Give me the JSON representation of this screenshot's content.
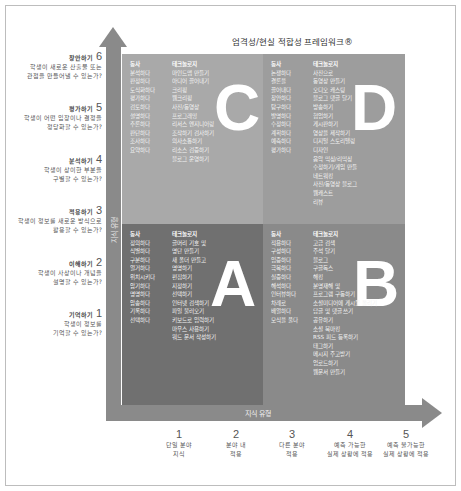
{
  "title": "엄격성/현실 적합성 프레임워크®",
  "axes": {
    "vertical_label": "지식 유형",
    "horizontal_label": "지식 유형"
  },
  "levels": [
    {
      "num": "6",
      "name": "창안하기",
      "desc1": "학생이 새로운 산출물 또는",
      "desc2": "관점을 만들어낼 수 있는가?"
    },
    {
      "num": "5",
      "name": "평가하기",
      "desc1": "학생이 어떤 입장이나 결정을",
      "desc2": "정당화할 수 있는가?"
    },
    {
      "num": "4",
      "name": "분석하기",
      "desc1": "학생이 상이한 부분을",
      "desc2": "구별할 수 있는가?"
    },
    {
      "num": "3",
      "name": "적용하기",
      "desc1": "학생이 정보를 새로운 방식으로",
      "desc2": "활용할 수 있는가?"
    },
    {
      "num": "2",
      "name": "이해하기",
      "desc1": "학생이 사상이나 개념을",
      "desc2": "설명할 수 있는가?"
    },
    {
      "num": "1",
      "name": "기억하기",
      "desc1": "학생이 정보를",
      "desc2": "기억할 수 있는가?"
    }
  ],
  "ticks": [
    {
      "num": "1",
      "line1": "단일 분야",
      "line2": "지식"
    },
    {
      "num": "2",
      "line1": "분야 내",
      "line2": "적용"
    },
    {
      "num": "3",
      "line1": "다른 분야",
      "line2": "적용"
    },
    {
      "num": "4",
      "line1": "예측 가능한",
      "line2": "실제 상황에 적용"
    },
    {
      "num": "5",
      "line1": "예측 불가능한",
      "line2": "실제 상황에 적용"
    }
  ],
  "quadrants": {
    "C": {
      "letter": "C",
      "verb_header": "동사",
      "tech_header": "테크놀로지",
      "verbs": [
        "분석하다",
        "판정하다",
        "도식화하다",
        "평가하다",
        "검토하다",
        "설명하다",
        "추론하다",
        "판단하다",
        "조사하다",
        "요약하다"
      ],
      "tech": [
        "마인드맵 만들기",
        "아디어 끌어내기",
        "크리핑",
        "웹크리핑",
        "사진/동영상",
        "프로그래밍",
        "리서스 엔지니어링",
        "조작하기 검사하기",
        "의사소통하기",
        "리소스 검증하기",
        "블로그 운영하기"
      ]
    },
    "D": {
      "letter": "D",
      "verb_header": "동사",
      "tech_header": "테크놀로지",
      "verbs": [
        "논쟁하다",
        "결론을",
        "끌어내다",
        "창안하다",
        "탐구하다",
        "발명하다",
        "수정하다",
        "계획하다",
        "예측하다",
        "평가하다"
      ],
      "tech": [
        "사진으로",
        "동영상 만들기",
        "오디오 캐스팅",
        "블로그 댓글 달기",
        "방송하기",
        "협업하기",
        "게시판하기",
        "영상을 제작하기",
        "디지털 스토리텔링",
        "디자인",
        "음악 믹싱/리믹싱",
        "수정하기/게임 만들",
        "네트워킹",
        "사진/동영상 블로그",
        "웹캐스트",
        "리뷰"
      ]
    },
    "A": {
      "letter": "A",
      "verb_header": "동사",
      "tech_header": "테크놀로지",
      "verbs": [
        "정의하다",
        "식별하다",
        "구분하다",
        "열거하다",
        "위치시키다",
        "암기하다",
        "명명하다",
        "암송하다",
        "기록하다",
        "선택하다"
      ],
      "tech": [
        "글머리 기호 및",
        "명단 만들기",
        "새 폴더 만들고",
        "명명하기",
        "편집하기",
        "지정하기",
        "선택하기",
        "인터넷 검색하기",
        "파일 불러오기",
        "키보드로 입력하기",
        "마우스 사용하기",
        "워드 문서 작성하기"
      ]
    },
    "B": {
      "letter": "B",
      "verb_header": "동사",
      "tech_header": "테크놀로지",
      "verbs": [
        "적용하다",
        "구성하다",
        "입증하다",
        "극복하다",
        "실증하다",
        "해석하다",
        "인터뷰하다",
        "차례로",
        "배열하다",
        "모식을 풀다"
      ],
      "tech": [
        "고급 검색",
        "주석 달기",
        "블로그",
        "구글독스",
        "해킹",
        "분명재해 및",
        "프로그램 구동하기",
        "소셜미디어에 게시물 올리기",
        "답글 및 댓글 쓰기",
        "공유하기",
        "소셜 북마킹",
        "RSS 피드 등록하기",
        "태그하기",
        "메시지 주고받기",
        "업로드하기",
        "웹문서 만들기"
      ]
    }
  }
}
